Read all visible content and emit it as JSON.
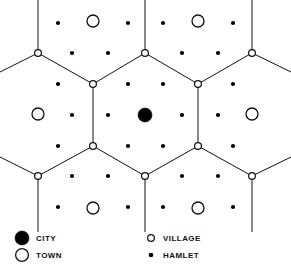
{
  "figure": {
    "background_color": "#ffffff",
    "line_color": "#111111",
    "width": 291,
    "height": 269
  },
  "chart_data": {
    "type": "scatter",
    "xlabel": "",
    "ylabel": "",
    "xlim": [
      0,
      291
    ],
    "ylim": [
      0,
      269
    ],
    "grid": false,
    "legend_position": "bottom",
    "series": [
      {
        "name": "CITY",
        "marker": "filled-circle",
        "radius": 7,
        "color": "#000000",
        "points": [
          [
            145,
            115
          ]
        ]
      },
      {
        "name": "TOWN",
        "marker": "open-circle",
        "radius": 6,
        "color": "#ffffff",
        "points": [
          [
            93,
            21
          ],
          [
            198,
            21
          ],
          [
            38,
            114
          ],
          [
            252,
            114
          ],
          [
            93,
            208
          ],
          [
            198,
            208
          ]
        ]
      },
      {
        "name": "VILLAGE",
        "marker": "small-open-circle",
        "radius": 3.4,
        "color": "#ffffff",
        "points": [
          [
            38,
            53
          ],
          [
            145,
            53
          ],
          [
            252,
            53
          ],
          [
            93,
            84
          ],
          [
            198,
            84
          ],
          [
            93,
            146
          ],
          [
            198,
            146
          ],
          [
            38,
            176
          ],
          [
            145,
            176
          ],
          [
            252,
            176
          ]
        ]
      },
      {
        "name": "HAMLET",
        "marker": "small-filled-dot",
        "radius": 2.1,
        "color": "#000000",
        "points": [
          [
            58,
            23
          ],
          [
            128,
            23
          ],
          [
            163,
            23
          ],
          [
            233,
            23
          ],
          [
            72,
            53
          ],
          [
            108,
            53
          ],
          [
            182,
            53
          ],
          [
            218,
            53
          ],
          [
            58,
            84
          ],
          [
            128,
            84
          ],
          [
            163,
            84
          ],
          [
            233,
            84
          ],
          [
            72,
            115
          ],
          [
            108,
            115
          ],
          [
            182,
            115
          ],
          [
            218,
            115
          ],
          [
            58,
            146
          ],
          [
            128,
            146
          ],
          [
            163,
            146
          ],
          [
            233,
            146
          ],
          [
            72,
            176
          ],
          [
            108,
            176
          ],
          [
            182,
            176
          ],
          [
            218,
            176
          ],
          [
            58,
            207
          ],
          [
            128,
            207
          ],
          [
            163,
            207
          ],
          [
            233,
            207
          ]
        ]
      }
    ],
    "hex_lattice": {
      "description": "Interlocking hexagonal market-area boundaries of the central place lattice",
      "center_hexagon_vertices": [
        [
          145,
          53
        ],
        [
          198,
          84
        ],
        [
          198,
          146
        ],
        [
          145,
          176
        ],
        [
          93,
          146
        ],
        [
          93,
          84
        ]
      ],
      "edges": [
        [
          [
            145,
            53
          ],
          [
            198,
            84
          ]
        ],
        [
          [
            198,
            84
          ],
          [
            198,
            146
          ]
        ],
        [
          [
            198,
            146
          ],
          [
            145,
            176
          ]
        ],
        [
          [
            145,
            176
          ],
          [
            93,
            146
          ]
        ],
        [
          [
            93,
            146
          ],
          [
            93,
            84
          ]
        ],
        [
          [
            93,
            84
          ],
          [
            145,
            53
          ]
        ],
        [
          [
            145,
            53
          ],
          [
            145,
            0
          ]
        ],
        [
          [
            93,
            84
          ],
          [
            38,
            53
          ]
        ],
        [
          [
            198,
            84
          ],
          [
            252,
            53
          ]
        ],
        [
          [
            93,
            146
          ],
          [
            38,
            176
          ]
        ],
        [
          [
            198,
            146
          ],
          [
            252,
            176
          ]
        ],
        [
          [
            145,
            176
          ],
          [
            145,
            232
          ]
        ],
        [
          [
            38,
            53
          ],
          [
            38,
            0
          ]
        ],
        [
          [
            38,
            53
          ],
          [
            0,
            72
          ]
        ],
        [
          [
            252,
            53
          ],
          [
            252,
            0
          ]
        ],
        [
          [
            252,
            53
          ],
          [
            291,
            72
          ]
        ],
        [
          [
            38,
            176
          ],
          [
            38,
            232
          ]
        ],
        [
          [
            38,
            176
          ],
          [
            0,
            157
          ]
        ],
        [
          [
            252,
            176
          ],
          [
            252,
            232
          ]
        ],
        [
          [
            252,
            176
          ],
          [
            291,
            157
          ]
        ]
      ]
    }
  },
  "legend": {
    "entries": [
      {
        "label": "CITY",
        "marker": "filled-circle",
        "x": 22,
        "y": 238,
        "text_x": 36,
        "radius": 7,
        "fill": "#000000"
      },
      {
        "label": "TOWN",
        "marker": "open-circle",
        "x": 22,
        "y": 255,
        "text_x": 36,
        "radius": 6.4,
        "fill": "#ffffff"
      },
      {
        "label": "VILLAGE",
        "marker": "small-open-circle",
        "x": 151,
        "y": 238,
        "text_x": 163,
        "radius": 3.4,
        "fill": "#ffffff"
      },
      {
        "label": "HAMLET",
        "marker": "small-filled-dot",
        "x": 151,
        "y": 255,
        "text_x": 163,
        "radius": 2.3,
        "fill": "#000000"
      }
    ]
  }
}
